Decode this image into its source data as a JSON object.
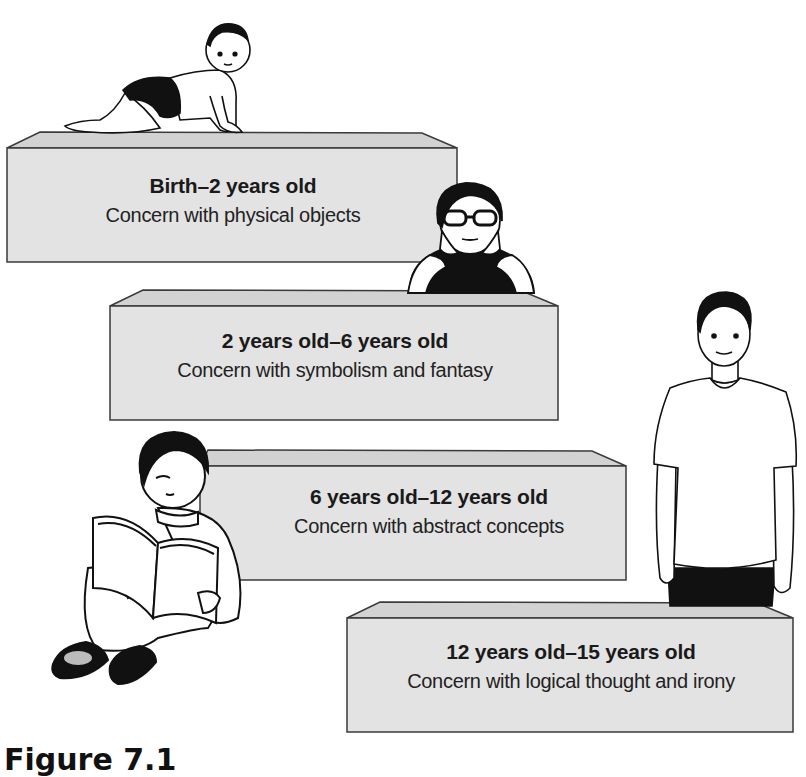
{
  "diagram": {
    "stages": [
      {
        "age_range": "Birth–2 years old",
        "description": "Concern with physical objects",
        "figure": "crawling-baby"
      },
      {
        "age_range": "2 years old–6 years old",
        "description": "Concern with symbolism and fantasy",
        "figure": "child-with-glasses"
      },
      {
        "age_range": "6 years old–12 years old",
        "description": "Concern with abstract concepts",
        "figure": "boy-reading-book"
      },
      {
        "age_range": "12 years old–15 years old",
        "description": "Concern with logical thought and irony",
        "figure": "standing-teen"
      }
    ],
    "caption": "Figure 7.1"
  },
  "colors": {
    "block_front": "#e3e3e3",
    "block_top": "#d2d2d2",
    "block_edge": "#3a3a3a",
    "text": "#1a1a1a"
  }
}
